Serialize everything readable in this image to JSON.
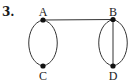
{
  "problem_number": "3.",
  "graph": {
    "vertices": [
      {
        "id": "A",
        "label": "A"
      },
      {
        "id": "B",
        "label": "B"
      },
      {
        "id": "C",
        "label": "C"
      },
      {
        "id": "D",
        "label": "D"
      }
    ],
    "edges": [
      {
        "from": "A",
        "to": "B",
        "kind": "straight"
      },
      {
        "from": "A",
        "to": "C",
        "kind": "curved-left"
      },
      {
        "from": "A",
        "to": "C",
        "kind": "curved-right"
      },
      {
        "from": "B",
        "to": "D",
        "kind": "curved-left"
      },
      {
        "from": "B",
        "to": "D",
        "kind": "curved-right"
      },
      {
        "from": "B",
        "to": "D",
        "kind": "straight"
      }
    ]
  },
  "colors": {
    "stroke": "#333333",
    "vertex": "#111111",
    "label": "#222222"
  }
}
